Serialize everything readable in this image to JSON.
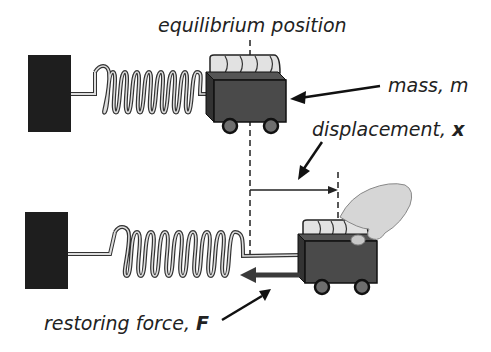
{
  "labels": {
    "equilibrium": "equilibrium position",
    "mass": "mass, m",
    "displacement_prefix": "displacement, ",
    "displacement_symbol": "x",
    "force_prefix": "restoring force, ",
    "force_symbol": "F"
  },
  "colors": {
    "wall": "#1e1e1e",
    "cart": "#4a4a4a",
    "cart_outline": "#111111",
    "mass_cylinder": "#e2e2e2",
    "wheel": "#6e6e6e",
    "force_arrow": "#3a3a3a"
  },
  "scenes": [
    {
      "name": "at-rest"
    },
    {
      "name": "displaced"
    }
  ]
}
